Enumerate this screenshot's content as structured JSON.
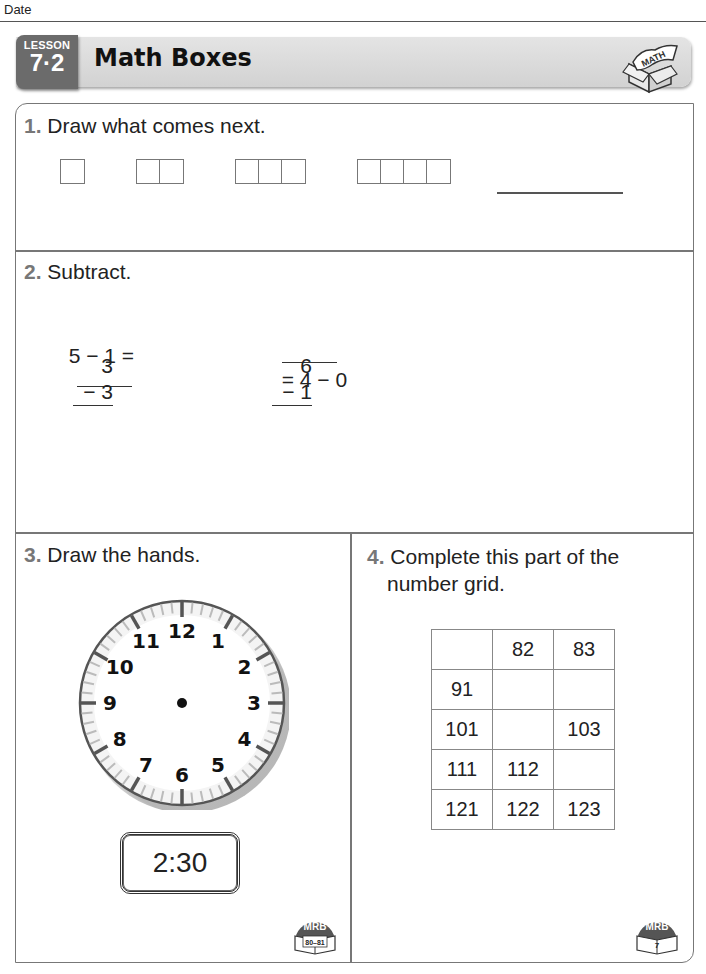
{
  "page": {
    "date_label": "Date"
  },
  "header": {
    "lesson_word": "LESSON",
    "lesson_number": "7·2",
    "title": "Math Boxes",
    "icon_label": "MATH"
  },
  "problems": {
    "p1": {
      "number": "1.",
      "prompt": "Draw what comes next.",
      "sequence_box_counts": [
        1,
        2,
        3,
        4
      ],
      "answer_blank": ""
    },
    "p2": {
      "number": "2.",
      "prompt": "Subtract.",
      "eq1": {
        "left": "5 − 1 =",
        "answer": ""
      },
      "eq2": {
        "answer": "",
        "right": "= 4 − 0"
      },
      "vertical1": {
        "top": "3",
        "bottom": "− 3"
      },
      "vertical2": {
        "top": "6",
        "bottom": "− 1"
      }
    },
    "p3": {
      "number": "3.",
      "prompt": "Draw the hands.",
      "clock_numbers": [
        "12",
        "1",
        "2",
        "3",
        "4",
        "5",
        "6",
        "7",
        "8",
        "9",
        "10",
        "11"
      ],
      "time": "2:30",
      "mrb": {
        "label": "MRB",
        "pages": "80–81"
      }
    },
    "p4": {
      "number": "4.",
      "prompt_line1": "Complete this part of the",
      "prompt_line2": "number grid.",
      "grid": [
        [
          "",
          "82",
          "83"
        ],
        [
          "91",
          "",
          ""
        ],
        [
          "101",
          "",
          "103"
        ],
        [
          "111",
          "112",
          ""
        ],
        [
          "121",
          "122",
          "123"
        ]
      ],
      "mrb": {
        "label": "MRB",
        "pages": "7"
      }
    }
  }
}
